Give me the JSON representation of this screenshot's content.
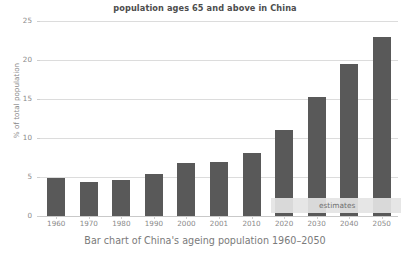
{
  "chart_data": {
    "type": "bar",
    "title": "population ages 65 and above in China",
    "xlabel": "",
    "ylabel": "% of total population",
    "categories": [
      "1960",
      "1970",
      "1980",
      "1990",
      "2000",
      "2001",
      "2010",
      "2020",
      "2030",
      "2040",
      "2050"
    ],
    "values": [
      4.9,
      4.4,
      4.6,
      5.4,
      6.8,
      6.9,
      8.1,
      11.0,
      15.3,
      19.5,
      23.0
    ],
    "ylim": [
      0,
      25
    ],
    "yticks": [
      0,
      5,
      10,
      15,
      20,
      25
    ],
    "ytick_labels": [
      "0",
      "5",
      "10",
      "15",
      "20",
      "25"
    ],
    "grid": true,
    "legend": "none",
    "bar_color": "#595959",
    "grid_color": "#dcdcdc",
    "annotations": [
      {
        "text": "estimates",
        "from_category": "2020",
        "to_category": "2050",
        "band_color": "#e4e4e4"
      }
    ]
  },
  "caption": {
    "text": "Bar chart of China's ageing population 1960–2050"
  }
}
